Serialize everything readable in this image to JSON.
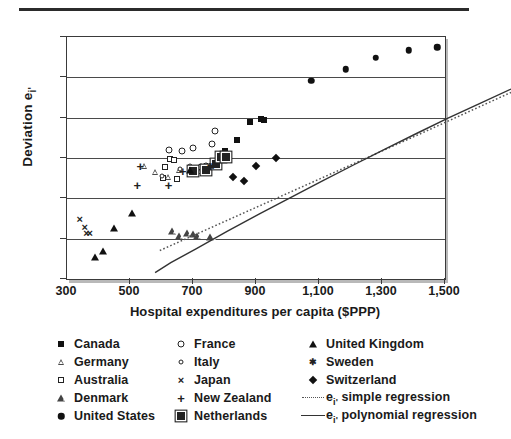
{
  "chart_data": {
    "type": "scatter",
    "title": "",
    "xlabel": "Hospital expenditures per capita ($PPP)",
    "ylabel": "Deviation e",
    "ylabel_sub": "i'",
    "xlim": [
      300,
      1500
    ],
    "ylim": [
      -3,
      3
    ],
    "xticks": [
      "300",
      "500",
      "700",
      "900",
      "1,100",
      "1,300",
      "1,500"
    ],
    "xtick_values": [
      300,
      500,
      700,
      900,
      1100,
      1300,
      1500
    ],
    "yticks": [
      "3",
      "2",
      "1",
      "0",
      "–1",
      "–2",
      "–3"
    ],
    "ytick_values": [
      3,
      2,
      1,
      0,
      -1,
      -2,
      -3
    ],
    "grid": "horizontal",
    "legend_position": "below",
    "series": [
      {
        "name": "Canada",
        "marker": "filled-square",
        "points": [
          [
            800,
            0.17
          ],
          [
            840,
            0.45
          ],
          [
            880,
            0.9
          ],
          [
            915,
            0.96
          ],
          [
            925,
            0.93
          ],
          [
            770,
            -0.12
          ],
          [
            700,
            -0.32
          ]
        ]
      },
      {
        "name": "Germany",
        "marker": "open-triangle-small",
        "points": [
          [
            545,
            -0.2
          ],
          [
            580,
            -0.35
          ],
          [
            620,
            -0.46
          ],
          [
            655,
            -0.3
          ],
          [
            690,
            -0.28
          ],
          [
            720,
            -0.33
          ]
        ]
      },
      {
        "name": "Australia",
        "marker": "open-square",
        "points": [
          [
            628,
            -0.02
          ],
          [
            640,
            -0.04
          ],
          [
            612,
            -0.22
          ],
          [
            605,
            -0.5
          ],
          [
            648,
            -0.52
          ]
        ]
      },
      {
        "name": "Denmark",
        "marker": "open-triangle",
        "points": [
          [
            633,
            -1.8
          ],
          [
            655,
            -1.93
          ],
          [
            680,
            -1.86
          ],
          [
            700,
            -1.88
          ],
          [
            712,
            -1.93
          ],
          [
            755,
            -1.97
          ]
        ]
      },
      {
        "name": "United States",
        "marker": "filled-circle",
        "points": [
          [
            1075,
            1.91
          ],
          [
            1185,
            2.2
          ],
          [
            1280,
            2.49
          ],
          [
            1385,
            2.67
          ],
          [
            1475,
            2.74
          ]
        ]
      },
      {
        "name": "France",
        "marker": "open-circle",
        "points": [
          [
            625,
            0.19
          ],
          [
            665,
            0.17
          ],
          [
            700,
            0.24
          ],
          [
            760,
            0.34
          ],
          [
            770,
            0.68
          ],
          [
            742,
            -0.2
          ],
          [
            724,
            -0.23
          ]
        ]
      },
      {
        "name": "Italy",
        "marker": "open-circle-small",
        "points": [
          [
            600,
            -0.45
          ],
          [
            660,
            -0.28
          ],
          [
            690,
            -0.21
          ],
          [
            745,
            -0.19
          ],
          [
            758,
            -0.17
          ]
        ]
      },
      {
        "name": "Japan",
        "marker": "x",
        "points": [
          [
            340,
            -1.52
          ],
          [
            356,
            -1.72
          ],
          [
            362,
            -1.87
          ],
          [
            372,
            -1.86
          ],
          [
            780,
            -0.23
          ]
        ]
      },
      {
        "name": "New Zealand",
        "marker": "plus",
        "points": [
          [
            533,
            -0.2
          ],
          [
            523,
            -0.66
          ],
          [
            622,
            -0.67
          ],
          [
            668,
            -0.32
          ]
        ]
      },
      {
        "name": "Netherlands",
        "marker": "bordered-square",
        "points": [
          [
            700,
            -0.33
          ],
          [
            740,
            -0.3
          ],
          [
            772,
            -0.15
          ],
          [
            790,
            0.02
          ],
          [
            806,
            0.03
          ]
        ]
      },
      {
        "name": "United Kingdom",
        "marker": "filled-triangle",
        "points": [
          [
            388,
            -2.45
          ],
          [
            415,
            -2.3
          ],
          [
            448,
            -1.74
          ],
          [
            505,
            -1.37
          ],
          [
            690,
            -0.3
          ]
        ]
      },
      {
        "name": "Sweden",
        "marker": "asterisk",
        "points": [
          [
            756,
            -0.22
          ]
        ]
      },
      {
        "name": "Switzerland",
        "marker": "filled-diamond",
        "points": [
          [
            828,
            -0.46
          ],
          [
            862,
            -0.57
          ],
          [
            900,
            -0.2
          ],
          [
            965,
            0.0
          ]
        ]
      }
    ],
    "fits": [
      {
        "name": "e_i' simple regression",
        "style": "dotted",
        "path": [
          [
            385,
            -1.4
          ],
          [
            600,
            -0.65
          ],
          [
            900,
            0.4
          ],
          [
            1200,
            1.45
          ],
          [
            1500,
            2.52
          ]
        ]
      },
      {
        "name": "e_i' polynomial regression",
        "style": "solid",
        "path": [
          [
            370,
            -1.95
          ],
          [
            420,
            -1.7
          ],
          [
            500,
            -1.36
          ],
          [
            600,
            -0.92
          ],
          [
            700,
            -0.5
          ],
          [
            800,
            -0.09
          ],
          [
            900,
            0.32
          ],
          [
            1000,
            0.72
          ],
          [
            1100,
            1.11
          ],
          [
            1200,
            1.5
          ],
          [
            1300,
            1.88
          ],
          [
            1400,
            2.24
          ],
          [
            1500,
            2.6
          ]
        ]
      }
    ]
  },
  "legend": {
    "columns": [
      {
        "entries": [
          {
            "label": "Canada",
            "marker": "filled-square"
          },
          {
            "label": "Germany",
            "marker": "open-triangle-small"
          },
          {
            "label": "Australia",
            "marker": "open-square"
          },
          {
            "label": "Denmark",
            "marker": "open-triangle"
          },
          {
            "label": "United States",
            "marker": "filled-circle"
          }
        ]
      },
      {
        "entries": [
          {
            "label": "France",
            "marker": "open-circle"
          },
          {
            "label": "Italy",
            "marker": "open-circle-small"
          },
          {
            "label": "Japan",
            "marker": "x"
          },
          {
            "label": "New Zealand",
            "marker": "plus"
          },
          {
            "label": "Netherlands",
            "marker": "bordered-square"
          }
        ]
      },
      {
        "entries": [
          {
            "label": "United Kingdom",
            "marker": "filled-triangle"
          },
          {
            "label": "Sweden",
            "marker": "asterisk"
          },
          {
            "label": "Switzerland",
            "marker": "filled-diamond"
          },
          {
            "label": "simple regression",
            "label_prefix": "e",
            "label_sub": "i'",
            "marker": "dotted-line"
          },
          {
            "label": "polynomial regression",
            "label_prefix": "e",
            "label_sub": "i'",
            "marker": "solid-line"
          }
        ]
      }
    ]
  },
  "colors": {
    "ink": "#1a1a1a",
    "axis": "#3a3a3a",
    "grid": "#4a4a4a",
    "rule": "#2b2b2b",
    "shadow": "#b9b9b9"
  }
}
